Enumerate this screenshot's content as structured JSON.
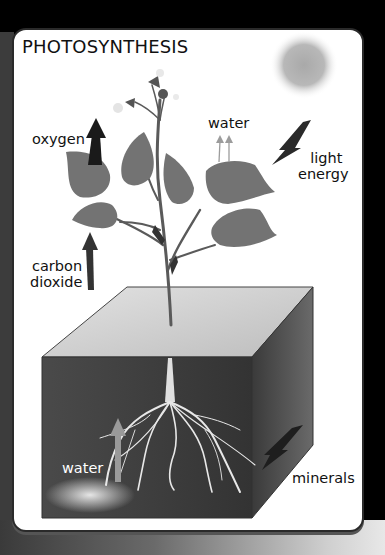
{
  "diagram": {
    "title": "PHOTOSYNTHESIS",
    "labels": {
      "oxygen": "oxygen",
      "water_top": "water",
      "light_energy_line1": "light",
      "light_energy_line2": "energy",
      "carbon_dioxide_line1": "carbon",
      "carbon_dioxide_line2": "dioxide",
      "water_soil": "water",
      "minerals": "minerals"
    },
    "elements": [
      "sun",
      "plant",
      "leaves",
      "flowers",
      "soil-block",
      "roots",
      "arrows"
    ],
    "palette": {
      "card": "#ffffff",
      "leaf": "#6f6f6f",
      "soil_front": "#3d3d3d",
      "soil_top": "#cfcfcf",
      "soil_side": "#555555",
      "roots": "#e8e8e8",
      "arrow_dark": "#2a2a2a",
      "sun": "#b5b5b5"
    }
  }
}
